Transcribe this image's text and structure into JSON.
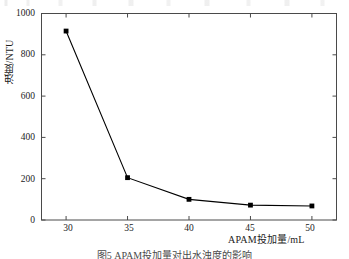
{
  "figure": {
    "caption": "图5  APAM投加量对出水浊度的影响"
  },
  "chart_data": {
    "type": "line",
    "title": "",
    "xlabel": "APAM投加量/mL",
    "ylabel": "浊度/NTU",
    "x": [
      30,
      35,
      40,
      45,
      50
    ],
    "values": [
      915,
      205,
      100,
      72,
      68
    ],
    "series": [
      {
        "name": "浊度",
        "values": [
          915,
          205,
          100,
          72,
          68
        ],
        "marker": "filled-square",
        "color": "#000000"
      }
    ],
    "xlim": [
      28,
      52
    ],
    "ylim": [
      0,
      1000
    ],
    "xticks": [
      30,
      35,
      40,
      45,
      50
    ],
    "yticks": [
      0,
      200,
      400,
      600,
      800,
      1000
    ],
    "xtick_labels": [
      "30",
      "35",
      "40",
      "45",
      "50"
    ],
    "ytick_labels": [
      "0",
      "200",
      "400",
      "600",
      "800",
      "1000"
    ],
    "grid": false,
    "legend": null,
    "frame": "box",
    "tick_direction": "in",
    "line_color": "#000000",
    "line_width": 1
  }
}
